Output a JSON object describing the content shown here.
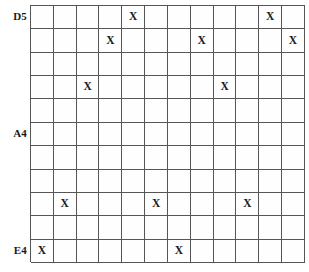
{
  "figure": {
    "name": "seating-grid",
    "top_clipped_text": "",
    "rows": 11,
    "cols": 12,
    "mark_symbol": "X",
    "line_color": "#555555",
    "text_color": "#1a1a1a",
    "background": "#ffffff"
  },
  "row_labels": [
    {
      "row": 1,
      "label": "D5"
    },
    {
      "row": 6,
      "label": "A4"
    },
    {
      "row": 11,
      "label": "E4"
    }
  ],
  "grid": {
    "marks": [
      {
        "row": 1,
        "col": 5
      },
      {
        "row": 1,
        "col": 11
      },
      {
        "row": 2,
        "col": 4
      },
      {
        "row": 2,
        "col": 8
      },
      {
        "row": 2,
        "col": 12
      },
      {
        "row": 4,
        "col": 3
      },
      {
        "row": 4,
        "col": 9
      },
      {
        "row": 9,
        "col": 2
      },
      {
        "row": 9,
        "col": 6
      },
      {
        "row": 9,
        "col": 10
      },
      {
        "row": 11,
        "col": 1
      },
      {
        "row": 11,
        "col": 7
      }
    ]
  }
}
